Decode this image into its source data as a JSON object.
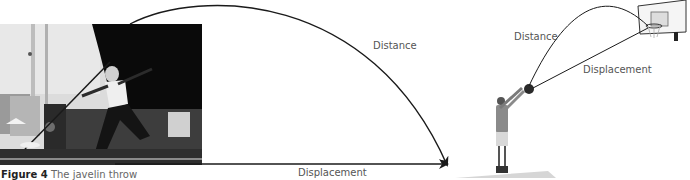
{
  "figure": {
    "caption_number": "Figure 4",
    "caption_text": "The javelin throw"
  },
  "javelin_diagram": {
    "image_description": "Black-and-white photo of athlete throwing a javelin in a stadium",
    "path_label": "Distance",
    "straight_label": "Displacement"
  },
  "basketball_diagram": {
    "image_description": "Illustration of basketball player shooting toward a hoop",
    "path_label": "Distance",
    "straight_label": "Displacement"
  },
  "colors": {
    "line": "#1a1a1a",
    "label_text": "#555555",
    "caption_bold": "#222222",
    "shadow": "#d6d6d6"
  }
}
